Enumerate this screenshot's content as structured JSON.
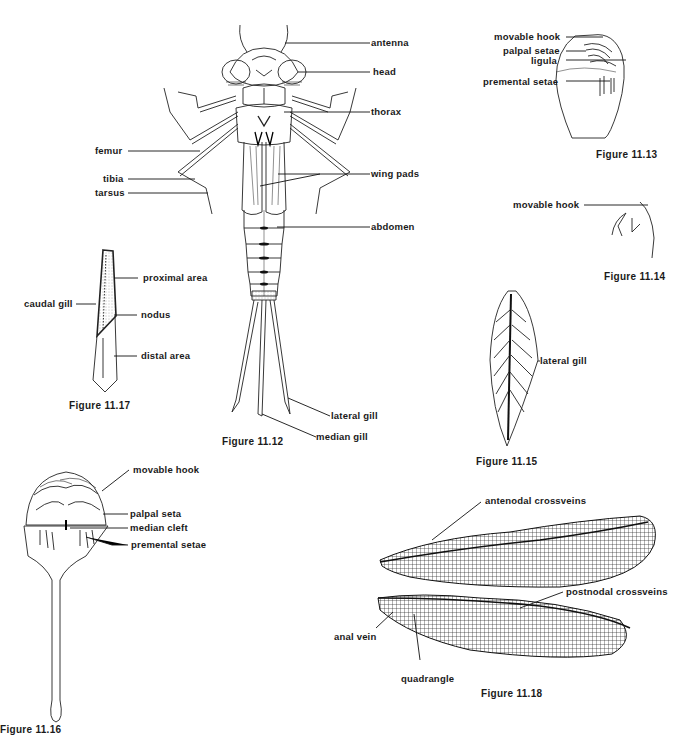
{
  "figures": {
    "fig_11_12": {
      "caption": "Figure 11.12",
      "labels": {
        "antenna": "antenna",
        "head": "head",
        "thorax": "thorax",
        "femur": "femur",
        "tibia": "tibia",
        "tarsus": "tarsus",
        "wing_pads": "wing pads",
        "abdomen": "abdomen",
        "lateral_gill": "lateral gill",
        "median_gill": "median gill"
      }
    },
    "fig_11_13": {
      "caption": "Figure 11.13",
      "labels": {
        "movable_hook": "movable hook",
        "palpal_setae": "palpal setae",
        "ligula": "ligula",
        "premental_setae": "premental setae"
      }
    },
    "fig_11_14": {
      "caption": "Figure 11.14",
      "labels": {
        "movable_hook": "movable hook"
      }
    },
    "fig_11_15": {
      "caption": "Figure 11.15",
      "labels": {
        "lateral_gill": "lateral gill"
      }
    },
    "fig_11_16": {
      "caption": "Figure 11.16",
      "labels": {
        "movable_hook": "movable hook",
        "palpal_seta": "palpal seta",
        "median_cleft": "median cleft",
        "premental_setae": "premental setae"
      }
    },
    "fig_11_17": {
      "caption": "Figure 11.17",
      "labels": {
        "caudal_gill": "caudal gill",
        "proximal_area": "proximal area",
        "nodus": "nodus",
        "distal_area": "distal area"
      }
    },
    "fig_11_18": {
      "caption": "Figure 11.18",
      "labels": {
        "antenodal_crossveins": "antenodal crossveins",
        "postnodal_crossveins": "postnodal crossveins",
        "anal_vein": "anal vein",
        "quadrangle": "quadrangle"
      }
    }
  }
}
